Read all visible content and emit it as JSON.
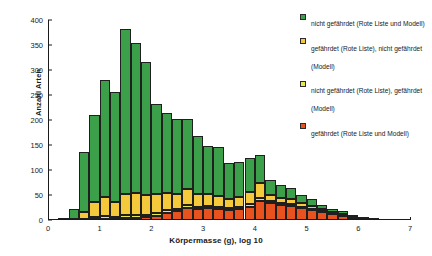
{
  "chart_data": {
    "type": "bar",
    "subtype": "stacked-histogram",
    "title": "",
    "xlabel": "Körpermasse (g), log 10",
    "ylabel": "Anzahl Arten",
    "xlim": [
      0,
      7
    ],
    "ylim": [
      0,
      400
    ],
    "xticks": [
      0,
      1,
      2,
      3,
      4,
      5,
      6,
      7
    ],
    "yticks": [
      0,
      50,
      100,
      150,
      200,
      250,
      300,
      350,
      400
    ],
    "grid": false,
    "legend_position": "top-right",
    "bin_width": 0.2,
    "bin_starts": [
      0.2,
      0.4,
      0.6,
      0.8,
      1.0,
      1.2,
      1.4,
      1.6,
      1.8,
      2.0,
      2.2,
      2.4,
      2.6,
      2.8,
      3.0,
      3.2,
      3.4,
      3.6,
      3.8,
      4.0,
      4.2,
      4.4,
      4.6,
      4.8,
      5.0,
      5.2,
      5.4,
      5.6,
      5.8,
      6.0,
      6.2
    ],
    "series": [
      {
        "name": "nicht gefährdet (Rote Liste und Modell)",
        "color": "#3CA04A",
        "values": [
          2,
          20,
          120,
          175,
          235,
          220,
          330,
          300,
          265,
          180,
          160,
          150,
          140,
          115,
          95,
          98,
          72,
          70,
          68,
          55,
          30,
          25,
          22,
          16,
          14,
          9,
          5,
          7,
          3,
          1,
          0
        ]
      },
      {
        "name": "gefährdet (Rote Liste), nicht gefährdet (Modell)",
        "color": "#F5C93C",
        "values": [
          0,
          2,
          14,
          30,
          38,
          30,
          42,
          44,
          40,
          38,
          34,
          30,
          32,
          26,
          24,
          22,
          18,
          20,
          24,
          30,
          12,
          11,
          10,
          8,
          6,
          4,
          3,
          2,
          1,
          0,
          0
        ]
      },
      {
        "name": "nicht gefährdet (Rote Liste), gefährdet (Modell)",
        "color": "#E8E84A",
        "values": [
          0,
          0,
          2,
          4,
          5,
          4,
          6,
          6,
          5,
          6,
          6,
          5,
          6,
          5,
          5,
          5,
          4,
          5,
          6,
          7,
          4,
          4,
          4,
          3,
          3,
          2,
          2,
          1,
          1,
          0,
          0
        ]
      },
      {
        "name": "gefährdet (Rote Liste und Modell)",
        "color": "#E8521E",
        "values": [
          0,
          0,
          1,
          2,
          3,
          3,
          4,
          5,
          6,
          8,
          14,
          18,
          24,
          22,
          24,
          22,
          20,
          22,
          26,
          38,
          34,
          30,
          28,
          24,
          20,
          16,
          12,
          9,
          5,
          2,
          1
        ]
      }
    ]
  },
  "legend": {
    "items": [
      {
        "label": "nicht gefährdet (Rote Liste und Modell)",
        "color": "#3CA04A"
      },
      {
        "label": "gefährdet (Rote Liste), nicht gefährdet (Modell)",
        "color": "#F5C93C"
      },
      {
        "label": "nicht gefährdet (Rote Liste), gefährdet (Modell)",
        "color": "#E8E84A"
      },
      {
        "label": "gefährdet (Rote Liste und Modell)",
        "color": "#E8521E"
      }
    ]
  }
}
